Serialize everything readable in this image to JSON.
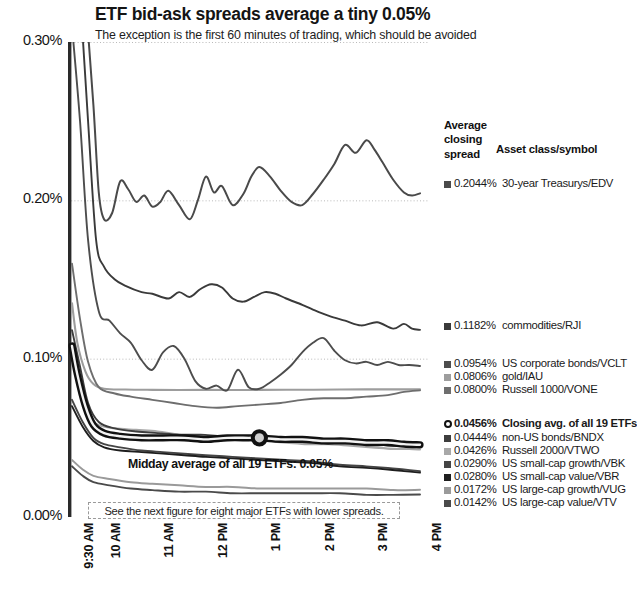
{
  "header": {
    "title": "ETF bid-ask spreads average a tiny 0.05%",
    "subtitle": "The exception is the first 60 minutes of trading, which should be avoided"
  },
  "legend": {
    "head_line1": "Average",
    "head_line2": "closing",
    "head_line3": "spread",
    "head_col2": "Asset class/symbol",
    "rows": [
      {
        "value": "0.2044%",
        "label": "30-year Treasurys/EDV",
        "color": "#4a4a4a",
        "marker": "square",
        "bold": false,
        "y": 60
      },
      {
        "value": "0.1182%",
        "label": "commodities/RJI",
        "color": "#3a3a3a",
        "marker": "square",
        "bold": false,
        "y": 202
      },
      {
        "value": "0.0954%",
        "label": "US corporate bonds/VCLT",
        "color": "#4d4d4d",
        "marker": "square",
        "bold": false,
        "y": 240
      },
      {
        "value": "0.0806%",
        "label": "gold/IAU",
        "color": "#9d9d9d",
        "marker": "square",
        "bold": false,
        "y": 253
      },
      {
        "value": "0.0800%",
        "label": "Russell 1000/VONE",
        "color": "#6e6e6e",
        "marker": "square",
        "bold": false,
        "y": 266
      },
      {
        "value": "0.0456%",
        "label": "Closing avg. of all 19 ETFs",
        "color": "#111111",
        "marker": "ring",
        "bold": true,
        "y": 300
      },
      {
        "value": "0.0444%",
        "label": "non-US bonds/BNDX",
        "color": "#3d3d3d",
        "marker": "square",
        "bold": false,
        "y": 314
      },
      {
        "value": "0.0426%",
        "label": "Russell 2000/VTWO",
        "color": "#a8a8a8",
        "marker": "square",
        "bold": false,
        "y": 327
      },
      {
        "value": "0.0290%",
        "label": "US small-cap growth/VBK",
        "color": "#454545",
        "marker": "square",
        "bold": false,
        "y": 340
      },
      {
        "value": "0.0280%",
        "label": "US small-cap value/VBR",
        "color": "#1e1e1e",
        "marker": "square",
        "bold": false,
        "y": 353
      },
      {
        "value": "0.0172%",
        "label": "US large-cap growth/VUG",
        "color": "#9a9a9a",
        "marker": "square",
        "bold": false,
        "y": 366
      },
      {
        "value": "0.0142%",
        "label": "US large-cap value/VTV",
        "color": "#4a4a4a",
        "marker": "square",
        "bold": false,
        "y": 379
      }
    ]
  },
  "annotations": {
    "midday": "Midday average of all 19 ETFs: 0.05%",
    "footnote": "See the next figure for eight major ETFs with lower spreads."
  },
  "chart_data": {
    "type": "line",
    "title": "ETF bid-ask spreads average a tiny 0.05%",
    "subtitle": "The exception is the first 60 minutes of trading, which should be avoided",
    "xlabel": "",
    "ylabel": "",
    "ylim": [
      0.0,
      0.3
    ],
    "yticks": [
      "0.00%",
      "0.10%",
      "0.20%",
      "0.30%"
    ],
    "ytick_values": [
      0.0,
      0.1,
      0.2,
      0.3
    ],
    "xticks": [
      "9:30 AM",
      "10 AM",
      "11 AM",
      "12 PM",
      "1 PM",
      "2 PM",
      "3 PM",
      "4 PM"
    ],
    "xtick_hours": [
      9.5,
      10,
      11,
      12,
      13,
      14,
      15,
      16
    ],
    "grid": "dotted-horizontal",
    "legend_position": "right",
    "annotation_marker": {
      "series": "Closing avg. of all 19 ETFs",
      "x": "1 PM",
      "y": 0.05,
      "label": "Midday average of all 19 ETFs: 0.05%"
    },
    "series": [
      {
        "name": "30-year Treasurys/EDV",
        "symbol": "EDV",
        "closing_spread": 0.2044,
        "color": "#4a4a4a",
        "width": 2.0,
        "x": [
          9.5,
          9.62,
          9.75,
          9.9,
          10.0,
          10.1,
          10.25,
          10.4,
          10.55,
          10.7,
          10.85,
          11.0,
          11.15,
          11.3,
          11.5,
          11.7,
          11.85,
          12.0,
          12.15,
          12.3,
          12.5,
          12.7,
          12.85,
          13.0,
          13.2,
          13.4,
          13.6,
          13.8,
          14.0,
          14.2,
          14.4,
          14.6,
          14.8,
          15.0,
          15.15,
          15.3,
          15.5,
          15.7,
          15.85,
          16.0
        ],
        "y": [
          0.47,
          0.4,
          0.33,
          0.26,
          0.205,
          0.188,
          0.192,
          0.212,
          0.207,
          0.199,
          0.203,
          0.196,
          0.199,
          0.206,
          0.197,
          0.188,
          0.2,
          0.215,
          0.205,
          0.209,
          0.197,
          0.204,
          0.215,
          0.221,
          0.215,
          0.206,
          0.199,
          0.197,
          0.204,
          0.213,
          0.223,
          0.235,
          0.23,
          0.238,
          0.232,
          0.224,
          0.213,
          0.205,
          0.203,
          0.2044
        ]
      },
      {
        "name": "commodities/RJI",
        "symbol": "RJI",
        "closing_spread": 0.1182,
        "color": "#3a3a3a",
        "width": 1.9,
        "x": [
          9.5,
          9.65,
          9.8,
          9.95,
          10.1,
          10.3,
          10.5,
          10.8,
          11.0,
          11.3,
          11.5,
          11.7,
          11.9,
          12.1,
          12.3,
          12.5,
          12.7,
          12.9,
          13.1,
          13.3,
          13.5,
          13.8,
          14.0,
          14.3,
          14.6,
          14.9,
          15.2,
          15.5,
          15.7,
          15.85,
          16.0
        ],
        "y": [
          0.4,
          0.33,
          0.25,
          0.175,
          0.158,
          0.15,
          0.146,
          0.142,
          0.141,
          0.138,
          0.142,
          0.139,
          0.144,
          0.147,
          0.145,
          0.138,
          0.136,
          0.139,
          0.142,
          0.141,
          0.138,
          0.134,
          0.131,
          0.127,
          0.124,
          0.121,
          0.123,
          0.119,
          0.122,
          0.119,
          0.1182
        ]
      },
      {
        "name": "US corporate bonds/VCLT",
        "symbol": "VCLT",
        "closing_spread": 0.0954,
        "color": "#4d4d4d",
        "width": 1.9,
        "x": [
          9.5,
          9.65,
          9.8,
          10.0,
          10.2,
          10.4,
          10.6,
          10.8,
          11.0,
          11.2,
          11.4,
          11.6,
          11.8,
          12.0,
          12.2,
          12.4,
          12.6,
          12.8,
          13.0,
          13.2,
          13.4,
          13.6,
          13.8,
          14.0,
          14.2,
          14.4,
          14.6,
          14.8,
          15.0,
          15.2,
          15.4,
          15.6,
          15.8,
          16.0
        ],
        "y": [
          0.31,
          0.25,
          0.175,
          0.13,
          0.124,
          0.116,
          0.11,
          0.099,
          0.093,
          0.104,
          0.108,
          0.1,
          0.086,
          0.081,
          0.083,
          0.08,
          0.093,
          0.082,
          0.081,
          0.085,
          0.09,
          0.096,
          0.104,
          0.11,
          0.113,
          0.105,
          0.099,
          0.097,
          0.098,
          0.096,
          0.098,
          0.096,
          0.096,
          0.0954
        ]
      },
      {
        "name": "gold/IAU",
        "symbol": "IAU",
        "closing_spread": 0.0806,
        "color": "#9d9d9d",
        "width": 2.1,
        "x": [
          9.5,
          9.6,
          9.75,
          9.9,
          10.1,
          10.5,
          11.0,
          11.5,
          12.0,
          12.5,
          13.0,
          13.5,
          14.0,
          14.5,
          15.0,
          15.5,
          16.0
        ],
        "y": [
          0.135,
          0.11,
          0.092,
          0.084,
          0.081,
          0.0805,
          0.0803,
          0.0802,
          0.0803,
          0.0802,
          0.0803,
          0.0804,
          0.0804,
          0.0805,
          0.0806,
          0.0806,
          0.0806
        ]
      },
      {
        "name": "Russell 1000/VONE",
        "symbol": "VONE",
        "closing_spread": 0.08,
        "color": "#6e6e6e",
        "width": 1.9,
        "x": [
          9.5,
          9.65,
          9.8,
          10.0,
          10.3,
          10.6,
          11.0,
          11.4,
          11.8,
          12.2,
          12.6,
          13.0,
          13.4,
          13.8,
          14.2,
          14.6,
          15.0,
          15.4,
          15.7,
          16.0
        ],
        "y": [
          0.16,
          0.125,
          0.098,
          0.082,
          0.078,
          0.076,
          0.074,
          0.072,
          0.07,
          0.069,
          0.07,
          0.071,
          0.072,
          0.074,
          0.075,
          0.075,
          0.076,
          0.077,
          0.079,
          0.08
        ]
      },
      {
        "name": "Closing avg. of all 19 ETFs",
        "symbol": "AVG19",
        "closing_spread": 0.0456,
        "color": "#111111",
        "width": 4.2,
        "x": [
          9.5,
          9.6,
          9.75,
          9.9,
          10.1,
          10.4,
          10.8,
          11.2,
          11.6,
          12.0,
          12.4,
          12.8,
          13.0,
          13.4,
          13.8,
          14.2,
          14.6,
          15.0,
          15.4,
          15.7,
          16.0
        ],
        "y": [
          0.108,
          0.09,
          0.07,
          0.058,
          0.053,
          0.051,
          0.05,
          0.05,
          0.05,
          0.049,
          0.05,
          0.05,
          0.05,
          0.049,
          0.049,
          0.048,
          0.048,
          0.047,
          0.047,
          0.046,
          0.0456
        ]
      },
      {
        "name": "non-US bonds/BNDX",
        "symbol": "BNDX",
        "closing_spread": 0.0444,
        "color": "#3d3d3d",
        "width": 1.9,
        "x": [
          9.5,
          9.65,
          9.8,
          10.0,
          10.3,
          10.7,
          11.1,
          11.5,
          11.9,
          12.3,
          12.7,
          13.1,
          13.5,
          13.9,
          14.3,
          14.7,
          15.1,
          15.5,
          15.8,
          16.0
        ],
        "y": [
          0.118,
          0.095,
          0.072,
          0.06,
          0.056,
          0.054,
          0.053,
          0.052,
          0.052,
          0.051,
          0.051,
          0.05,
          0.05,
          0.049,
          0.048,
          0.047,
          0.046,
          0.045,
          0.045,
          0.0444
        ]
      },
      {
        "name": "Russell 2000/VTWO",
        "symbol": "VTWO",
        "closing_spread": 0.0426,
        "color": "#a8a8a8",
        "width": 2.1,
        "x": [
          9.5,
          9.65,
          9.8,
          10.0,
          10.3,
          10.7,
          11.1,
          11.5,
          11.9,
          12.3,
          12.7,
          13.1,
          13.5,
          13.9,
          14.3,
          14.7,
          15.1,
          15.5,
          15.8,
          16.0
        ],
        "y": [
          0.1,
          0.08,
          0.064,
          0.058,
          0.056,
          0.055,
          0.054,
          0.052,
          0.051,
          0.05,
          0.049,
          0.048,
          0.047,
          0.046,
          0.046,
          0.045,
          0.044,
          0.043,
          0.043,
          0.0426
        ]
      },
      {
        "name": "US small-cap growth/VBK",
        "symbol": "VBK",
        "closing_spread": 0.029,
        "color": "#454545",
        "width": 1.9,
        "x": [
          9.5,
          9.7,
          9.9,
          10.1,
          10.4,
          10.8,
          11.2,
          11.6,
          12.0,
          12.5,
          13.0,
          13.5,
          14.0,
          14.5,
          15.0,
          15.4,
          15.7,
          16.0
        ],
        "y": [
          0.074,
          0.06,
          0.05,
          0.046,
          0.044,
          0.042,
          0.041,
          0.04,
          0.039,
          0.038,
          0.037,
          0.036,
          0.035,
          0.033,
          0.032,
          0.031,
          0.03,
          0.029
        ]
      },
      {
        "name": "US small-cap value/VBR",
        "symbol": "VBR",
        "closing_spread": 0.028,
        "color": "#1e1e1e",
        "width": 1.9,
        "x": [
          9.5,
          9.7,
          9.9,
          10.1,
          10.4,
          10.8,
          11.2,
          11.6,
          12.0,
          12.5,
          13.0,
          13.5,
          14.0,
          14.5,
          15.0,
          15.4,
          15.7,
          16.0
        ],
        "y": [
          0.07,
          0.057,
          0.048,
          0.044,
          0.042,
          0.041,
          0.04,
          0.039,
          0.038,
          0.037,
          0.036,
          0.035,
          0.034,
          0.032,
          0.031,
          0.03,
          0.029,
          0.028
        ]
      },
      {
        "name": "US large-cap growth/VUG",
        "symbol": "VUG",
        "closing_spread": 0.0172,
        "color": "#9a9a9a",
        "width": 2.0,
        "x": [
          9.5,
          9.7,
          9.9,
          10.2,
          10.6,
          11.0,
          11.5,
          12.0,
          12.5,
          13.0,
          13.5,
          14.0,
          14.5,
          15.0,
          15.5,
          16.0
        ],
        "y": [
          0.036,
          0.03,
          0.026,
          0.024,
          0.022,
          0.021,
          0.02,
          0.019,
          0.019,
          0.018,
          0.018,
          0.018,
          0.018,
          0.018,
          0.017,
          0.0172
        ]
      },
      {
        "name": "US large-cap value/VTV",
        "symbol": "VTV",
        "closing_spread": 0.0142,
        "color": "#4a4a4a",
        "width": 1.9,
        "x": [
          9.5,
          9.7,
          9.9,
          10.2,
          10.6,
          11.0,
          11.5,
          12.0,
          12.5,
          13.0,
          13.5,
          14.0,
          14.5,
          15.0,
          15.5,
          16.0
        ],
        "y": [
          0.032,
          0.026,
          0.022,
          0.02,
          0.018,
          0.017,
          0.016,
          0.016,
          0.015,
          0.015,
          0.015,
          0.015,
          0.015,
          0.014,
          0.014,
          0.0142
        ]
      }
    ]
  }
}
